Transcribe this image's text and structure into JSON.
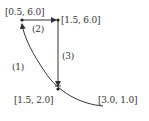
{
  "diagram": {
    "type": "path-diagram",
    "colors": {
      "line": "#333333",
      "text": "#333333",
      "background": "#ffffff"
    },
    "points": [
      {
        "id": "A",
        "label": "[0.5, 6.0]"
      },
      {
        "id": "B",
        "label": "[1.5, 6.0]"
      },
      {
        "id": "C",
        "label": "[1.5, 2.0]"
      },
      {
        "id": "D",
        "label": "[3.0, 1.0]"
      }
    ],
    "paths": [
      {
        "id": "1",
        "label": "(1)",
        "from": "D",
        "to": "A",
        "shape": "curve"
      },
      {
        "id": "2",
        "label": "(2)",
        "from": "A",
        "to": "B",
        "shape": "straight"
      },
      {
        "id": "3",
        "label": "(3)",
        "from": "B",
        "to": "C",
        "shape": "straight"
      }
    ]
  }
}
